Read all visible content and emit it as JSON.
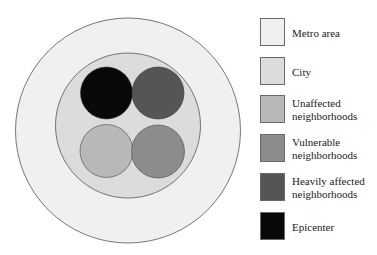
{
  "diagram": {
    "type": "nested-circle-diagram",
    "regions": [
      {
        "key": "metro",
        "label": "Metro area",
        "color": "#f0f0f0"
      },
      {
        "key": "city",
        "label": "City",
        "color": "#dcdcdc"
      },
      {
        "key": "unaffected",
        "label": "Unaffected neighborhoods",
        "color": "#b8b8b8"
      },
      {
        "key": "vulnerable",
        "label": "Vulnerable neighborhoods",
        "color": "#8c8c8c"
      },
      {
        "key": "heavily",
        "label": "Heavily affected neighborhoods",
        "color": "#555555"
      },
      {
        "key": "epicenter",
        "label": "Epicenter",
        "color": "#080808"
      }
    ]
  },
  "legend": {
    "items": [
      {
        "label": "Metro area",
        "color": "#f0f0f0"
      },
      {
        "label": "City",
        "color": "#dcdcdc"
      },
      {
        "label": "Unaffected neighborhoods",
        "color": "#b8b8b8"
      },
      {
        "label": "Vulnerable neighborhoods",
        "color": "#8c8c8c"
      },
      {
        "label": "Heavily affected neighborhoods",
        "color": "#555555"
      },
      {
        "label": "Epicenter",
        "color": "#080808"
      }
    ]
  }
}
